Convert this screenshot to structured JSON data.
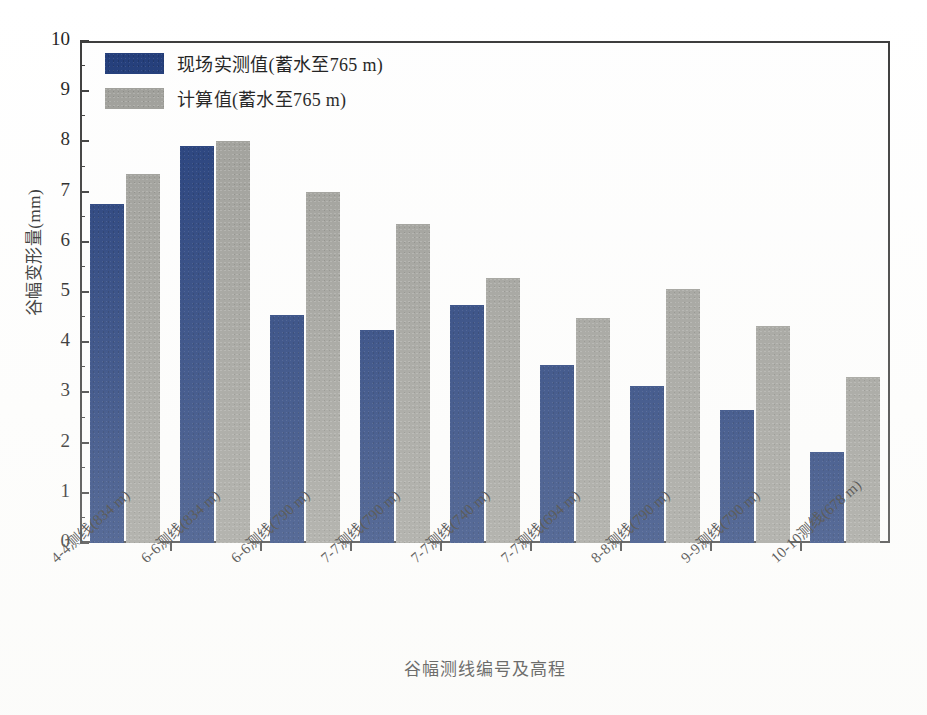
{
  "chart_data": {
    "type": "bar",
    "title": "",
    "xlabel": "谷幅测线编号及高程",
    "ylabel": "谷幅变形量(mm)",
    "ylim": [
      0,
      10
    ],
    "ytick_step": 1,
    "yminor_step": 0.5,
    "grid": false,
    "legend_position": "upper left",
    "categories": [
      "4-4测线(834 m)",
      "6-6测线(834 m)",
      "6-6测线(790 m)",
      "7-7测线(790 m)",
      "7-7测线(740 m)",
      "7-7测线(694 m)",
      "8-8测线(790 m)",
      "9-9测线(790 m)",
      "10-10测线(678 m)"
    ],
    "ytick_labels": [
      "0",
      "1",
      "2",
      "3",
      "4",
      "5",
      "6",
      "7",
      "8",
      "9",
      "10"
    ],
    "series": [
      {
        "name": "现场实测值(蓄水至765 m)",
        "color": "#1f3a78",
        "values": [
          6.75,
          7.9,
          4.55,
          4.25,
          4.75,
          3.55,
          3.13,
          2.65,
          1.81
        ]
      },
      {
        "name": "计算值(蓄水至765 m)",
        "color": "#9d9d98",
        "values": [
          7.35,
          8.0,
          7.0,
          6.35,
          5.28,
          4.48,
          5.06,
          4.32,
          3.31
        ]
      }
    ]
  },
  "legend": {
    "items": [
      {
        "label": "现场实测值(蓄水至765 m)",
        "color": "#1f3a78"
      },
      {
        "label": "计算值(蓄水至765 m)",
        "color": "#9d9d98"
      }
    ]
  },
  "axes": {
    "y_title": "谷幅变形量(mm)",
    "x_title": "谷幅测线编号及高程"
  }
}
